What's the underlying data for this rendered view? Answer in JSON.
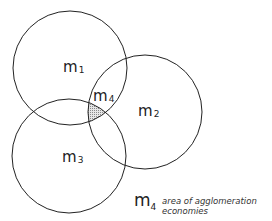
{
  "diagram": {
    "type": "venn",
    "circles": [
      {
        "id": "m1",
        "label": "m",
        "sub": "1",
        "cx": 70,
        "cy": 68,
        "r": 57
      },
      {
        "id": "m2",
        "label": "m",
        "sub": "2",
        "cx": 145,
        "cy": 112,
        "r": 57
      },
      {
        "id": "m3",
        "label": "m",
        "sub": "3",
        "cx": 69,
        "cy": 156,
        "r": 57
      }
    ],
    "intersection": {
      "label": "m",
      "sub": "4",
      "fill": "#bdbdbd"
    },
    "legend": {
      "symbol": "m",
      "symbol_sub": "4",
      "line1": "area of agglomeration",
      "line2": "economies"
    },
    "stroke_color": "#222222"
  }
}
